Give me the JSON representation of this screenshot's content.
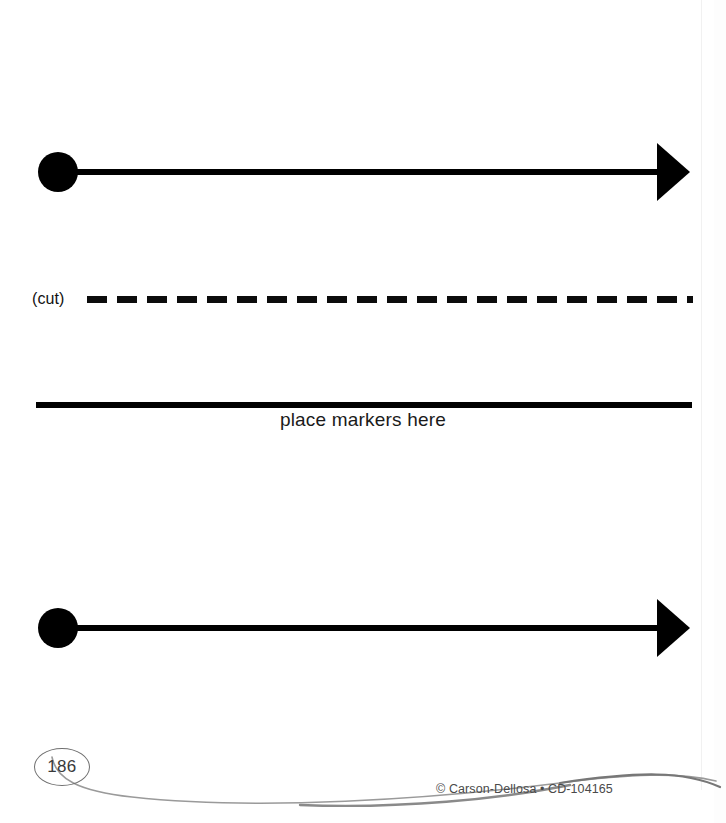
{
  "page": {
    "width": 726,
    "height": 823,
    "background": "#ffffff",
    "ink_color": "#000000"
  },
  "number_lines": [
    {
      "id": "number-line-top",
      "label": "blank number line with endpoint dot and right arrowhead",
      "top": 140,
      "dot_center_x": 58,
      "dot_radius": 20,
      "shaft_start_x": 58,
      "shaft_end_x": 662,
      "arrow_tip_x": 690,
      "center_y": 32
    },
    {
      "id": "number-line-bottom",
      "label": "blank number line with endpoint dot and right arrowhead",
      "top": 596,
      "dot_center_x": 58,
      "dot_radius": 20,
      "shaft_start_x": 58,
      "shaft_end_x": 662,
      "arrow_tip_x": 690,
      "center_y": 32
    }
  ],
  "cut_line": {
    "label": "(cut)",
    "dash_length": 20,
    "dash_gap": 10,
    "thickness": 7
  },
  "markers_section": {
    "caption": "place markers here",
    "rule_thickness": 6
  },
  "footer": {
    "page_number": "186",
    "copyright": "© Carson-Dellosa • CD-104165",
    "swoosh_color": "#8c8c8c"
  }
}
